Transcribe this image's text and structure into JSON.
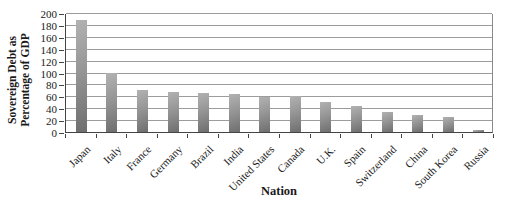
{
  "chart_data": {
    "type": "bar",
    "title": "",
    "xlabel": "Nation",
    "ylabel": "Sovereign Debt as Percentage of GDP",
    "ylabel_line1": "Sovereign Debt as",
    "ylabel_line2": "Percentage of GDP",
    "categories": [
      "Japan",
      "Italy",
      "France",
      "Germany",
      "Brazil",
      "India",
      "United States",
      "Canada",
      "U.K.",
      "Spain",
      "Switzerland",
      "China",
      "South Korea",
      "Russia"
    ],
    "values": [
      188,
      99,
      71,
      68,
      65,
      64,
      59,
      60,
      50,
      43,
      34,
      29,
      25,
      4
    ],
    "ylim": [
      0,
      200
    ],
    "ytick_step": 20,
    "yticks": [
      0,
      20,
      40,
      60,
      80,
      100,
      120,
      140,
      160,
      180,
      200
    ],
    "grid": true,
    "legend_position": "none",
    "bar_gradient_light": "#b2b2b2",
    "bar_gradient_dark": "#6e6e6e",
    "gridline_color": "#9c9c9c",
    "axis_color": "#444444",
    "text_color": "#1a1a1a"
  }
}
